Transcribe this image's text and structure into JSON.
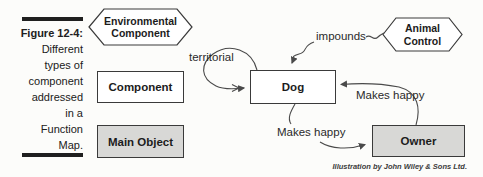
{
  "figure_caption": {
    "label": "Figure 12-4:",
    "lines": [
      "Different",
      "types of",
      "component",
      "addressed",
      "in a",
      "Function",
      "Map."
    ]
  },
  "legend": {
    "environmental_hexagon": {
      "line1": "Environmental",
      "line2": "Component"
    },
    "component_box": "Component",
    "main_object_box": "Main Object"
  },
  "diagram": {
    "nodes": {
      "dog": "Dog",
      "owner": "Owner",
      "animal_control": {
        "line1": "Animal",
        "line2": "Control"
      }
    },
    "edge_labels": {
      "territorial": "territorial",
      "impounds": "impounds",
      "makes_happy_owner_to_dog": "Makes happy",
      "makes_happy_dog_to_owner": "Makes happy"
    }
  },
  "credit": "Illustration by John Wiley & Sons Ltd.",
  "colors": {
    "background": "#fcfcfa",
    "box_border": "#3a3a3a",
    "shaded_fill": "#d8d8d6",
    "arrow_stroke": "#4a4a4a",
    "caption_bar": "#1f1f1f"
  }
}
